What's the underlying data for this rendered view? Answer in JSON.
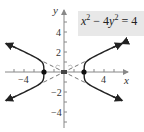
{
  "diagram": {
    "equation": {
      "var1": "x",
      "exp1": "2",
      "op": " − 4",
      "var2": "y",
      "exp2": "2",
      "rhs": " = 4"
    },
    "axes": {
      "x_label": "x",
      "y_label": "y",
      "x_ticks": [
        "−4",
        "4"
      ],
      "y_ticks": [
        "4",
        "2",
        "−2",
        "−4"
      ]
    },
    "vertices": [
      {
        "x": -2,
        "y": 0
      },
      {
        "x": 2,
        "y": 0
      }
    ],
    "center": {
      "x": 0,
      "y": 0
    },
    "asymptotes": [
      "y = x/2",
      "y = −x/2"
    ],
    "colors": {
      "curve": "#222222",
      "asymptote": "#555555",
      "axis": "#666666",
      "equation_bg": "#e8e8e8"
    }
  }
}
